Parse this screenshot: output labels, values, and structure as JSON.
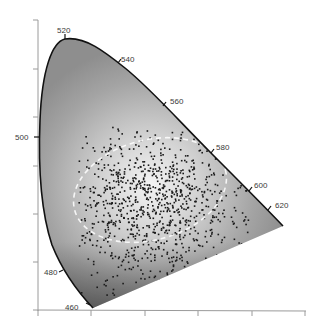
{
  "chart_data": {
    "type": "scatter",
    "title": "",
    "subtitle": "",
    "xlabel": "",
    "ylabel": "",
    "grid": false,
    "legend": null,
    "spectral_locus_labels": [
      {
        "nm": "460",
        "px": [
          93,
          308
        ]
      },
      {
        "nm": "480",
        "px": [
          65,
          270
        ]
      },
      {
        "nm": "500",
        "px": [
          40,
          137
        ]
      },
      {
        "nm": "520",
        "px": [
          65,
          40
        ]
      },
      {
        "nm": "540",
        "px": [
          118,
          65
        ]
      },
      {
        "nm": "560",
        "px": [
          163,
          107
        ]
      },
      {
        "nm": "580",
        "px": [
          211,
          153
        ]
      },
      {
        "nm": "600",
        "px": [
          249,
          191
        ]
      },
      {
        "nm": "620",
        "px": [
          268,
          208
        ]
      }
    ],
    "x_axis": {
      "tick_count": 6,
      "tick_labels": []
    },
    "y_axis": {
      "tick_count": 7,
      "tick_labels": []
    },
    "points": {
      "count_approx": 900,
      "color": "#1a1a1a",
      "region": "central / lower-left of gamut"
    },
    "ellipse": {
      "style": "dashed",
      "color": "#ffffff",
      "center_px": [
        150,
        190
      ],
      "rx": 78,
      "ry": 50,
      "rotation_deg": -15
    }
  },
  "labels": {
    "l460": "460",
    "l480": "480",
    "l500": "500",
    "l520": "520",
    "l540": "540",
    "l560": "560",
    "l580": "580",
    "l600": "600",
    "l620": "620"
  },
  "colors": {
    "fill_light": "#eeeeee",
    "fill_mid": "#a8a8a8",
    "fill_dark": "#3a3a3a",
    "locus_stroke": "#111111",
    "axis": "#9a9a9a",
    "dot": "#1a1a1a"
  }
}
